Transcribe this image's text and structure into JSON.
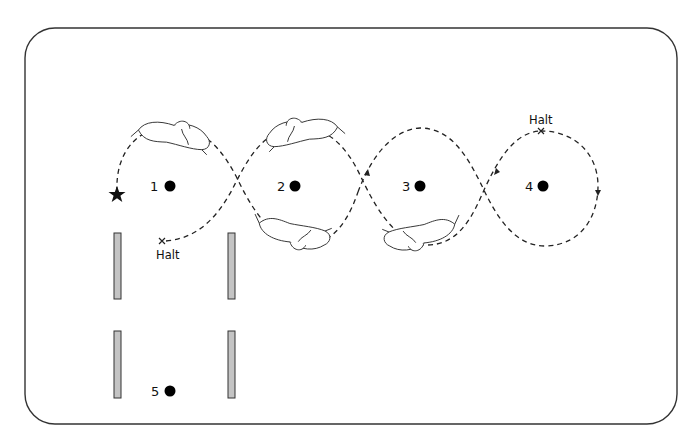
{
  "diagram": {
    "markers": [
      {
        "id": "1",
        "label": "1"
      },
      {
        "id": "2",
        "label": "2"
      },
      {
        "id": "3",
        "label": "3"
      },
      {
        "id": "4",
        "label": "4"
      },
      {
        "id": "5",
        "label": "5"
      }
    ],
    "start": {
      "icon": "star-icon",
      "meaning": "start"
    },
    "halts": [
      {
        "label": "Halt",
        "near_marker": "1"
      },
      {
        "label": "Halt",
        "near_marker": "4"
      }
    ],
    "poles": {
      "count": 4,
      "color": "#c4c4c4"
    },
    "path": {
      "style": "dashed",
      "color": "#222222"
    },
    "riders": {
      "count": 5
    }
  }
}
